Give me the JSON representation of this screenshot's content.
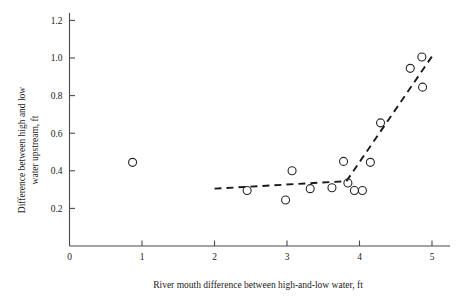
{
  "chart_data": {
    "type": "scatter",
    "title": "",
    "xlabel": "River mouth difference between high-and-low water, ft",
    "ylabel": "Difference between high and low water upstream, ft",
    "ylabel_line1": "Difference between high and low",
    "ylabel_line2": "water upstream, ft",
    "xlim": [
      0,
      5.2
    ],
    "ylim": [
      0,
      1.2
    ],
    "xticks": [
      0,
      1,
      2,
      3,
      4,
      5
    ],
    "xtick_labels": [
      "0",
      "1",
      "2",
      "3",
      "4",
      "5"
    ],
    "yticks": [
      0.2,
      0.4,
      0.6,
      0.8,
      1.0,
      1.2
    ],
    "ytick_labels": [
      "0.2",
      "0.4",
      "0.6",
      "0.8",
      "1.0",
      "1.2"
    ],
    "grid": false,
    "legend": false,
    "marker": "open-circle",
    "marker_radius_px": 4,
    "points": [
      {
        "x": 0.87,
        "y": 0.445
      },
      {
        "x": 2.45,
        "y": 0.295
      },
      {
        "x": 2.98,
        "y": 0.245
      },
      {
        "x": 3.07,
        "y": 0.4
      },
      {
        "x": 3.32,
        "y": 0.305
      },
      {
        "x": 3.62,
        "y": 0.31
      },
      {
        "x": 3.78,
        "y": 0.45
      },
      {
        "x": 3.84,
        "y": 0.335
      },
      {
        "x": 3.93,
        "y": 0.295
      },
      {
        "x": 4.04,
        "y": 0.295
      },
      {
        "x": 4.15,
        "y": 0.445
      },
      {
        "x": 4.29,
        "y": 0.655
      },
      {
        "x": 4.7,
        "y": 0.945
      },
      {
        "x": 4.86,
        "y": 1.005
      },
      {
        "x": 4.87,
        "y": 0.845
      }
    ],
    "trend_segments": [
      {
        "name": "flat-segment",
        "x1": 2.0,
        "y1": 0.305,
        "x2": 3.82,
        "y2": 0.345
      },
      {
        "name": "rising-segment",
        "x1": 3.82,
        "y1": 0.345,
        "x2": 5.02,
        "y2": 1.02
      }
    ],
    "colors": {
      "axis": "#4a4a4a",
      "marker": "#262626",
      "trend": "#1a1a1a",
      "background": "#ffffff"
    }
  }
}
